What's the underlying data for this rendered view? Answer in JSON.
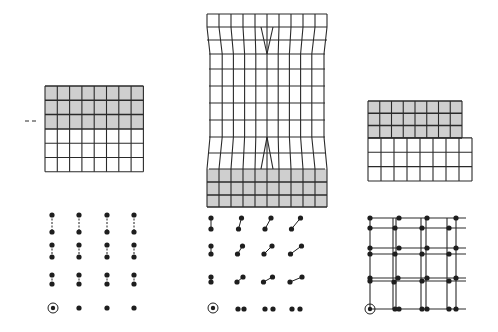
{
  "figure": {
    "colors": {
      "line": "#2a2a2a",
      "shade": "#cfcfcf",
      "dot": "#1e1e1e",
      "background": "#ffffff"
    },
    "panels": [
      {
        "id": "left",
        "grid": {
          "x": 45,
          "y": 86,
          "cols": 8,
          "rows": 6,
          "cell_w": 12.3,
          "cell_h": 14.3,
          "shaded_rows": [
            0,
            1,
            2
          ]
        },
        "marker": {
          "type": "dash",
          "x1": 25,
          "x2": 39,
          "y": 121
        },
        "dots": {
          "columns": [
            52,
            79,
            107,
            134
          ],
          "pairs": [
            {
              "y_top": 215,
              "y_bot": 232,
              "dx": 0
            },
            {
              "y_top": 245,
              "y_bot": 257,
              "dx": 0
            },
            {
              "y_top": 275,
              "y_bot": 284,
              "dx": 0
            }
          ],
          "singles_y": 308,
          "origin": {
            "x": 53,
            "y": 308
          }
        }
      },
      {
        "id": "center",
        "grid": {
          "x": 207,
          "y": 14,
          "cols": 10,
          "rows": 14,
          "w": 120,
          "h": 193,
          "shaded_rows_bottom": 3
        },
        "dots": {
          "columns": [
            211,
            238,
            266,
            294
          ],
          "origin": {
            "x": 213,
            "y": 308
          }
        }
      },
      {
        "id": "right",
        "grid": {
          "x": 368,
          "y": 101,
          "cols": 8,
          "shaded_rows": 3,
          "upper_w": 94,
          "lower_w": 104,
          "row_h": 12.3,
          "lower_rows": 3,
          "bottom": 181
        },
        "lattice": {
          "origin": {
            "x": 370,
            "y": 309
          }
        }
      }
    ]
  }
}
